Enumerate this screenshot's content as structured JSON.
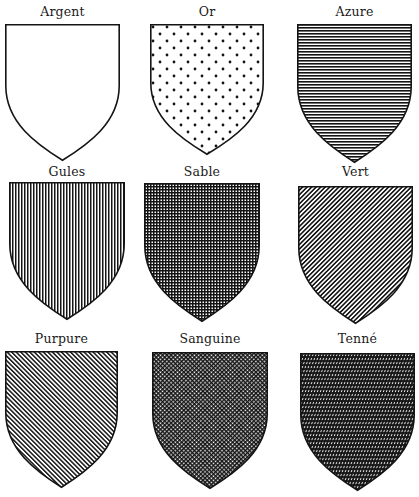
{
  "colors": {
    "ink": "#141414",
    "paper": "#ffffff"
  },
  "shields": [
    {
      "name": "Argent",
      "hatching": "plain",
      "row": 0,
      "col": 0,
      "x": 5,
      "y": 24,
      "w": 115,
      "h": 137,
      "label_y": 4
    },
    {
      "name": "Or",
      "hatching": "dots",
      "row": 0,
      "col": 1,
      "x": 150,
      "y": 24,
      "w": 114,
      "h": 131,
      "label_y": 4
    },
    {
      "name": "Azure",
      "hatching": "horizontal-lines",
      "row": 0,
      "col": 2,
      "x": 297,
      "y": 24,
      "w": 115,
      "h": 139,
      "label_y": 4
    },
    {
      "name": "Gules",
      "hatching": "vertical-lines",
      "row": 1,
      "col": 0,
      "x": 9,
      "y": 182,
      "w": 116,
      "h": 138,
      "label_y": 164
    },
    {
      "name": "Sable",
      "hatching": "cross-hatch",
      "row": 1,
      "col": 1,
      "x": 144,
      "y": 183,
      "w": 116,
      "h": 139,
      "label_y": 164
    },
    {
      "name": "Vert",
      "hatching": "diagonal-dexter",
      "row": 1,
      "col": 2,
      "x": 298,
      "y": 186,
      "w": 115,
      "h": 138,
      "label_y": 164
    },
    {
      "name": "Purpure",
      "hatching": "diagonal-sinister",
      "row": 2,
      "col": 0,
      "x": 5,
      "y": 351,
      "w": 113,
      "h": 137,
      "label_y": 331
    },
    {
      "name": "Sanguine",
      "hatching": "diagonal-cross",
      "row": 2,
      "col": 1,
      "x": 152,
      "y": 352,
      "w": 116,
      "h": 137,
      "label_y": 331
    },
    {
      "name": "Tenné",
      "hatching": "sinister-over-vertical",
      "row": 2,
      "col": 2,
      "x": 300,
      "y": 353,
      "w": 115,
      "h": 138,
      "label_y": 331
    }
  ]
}
